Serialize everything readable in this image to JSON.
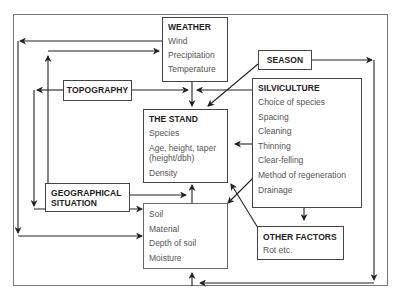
{
  "diagram": {
    "weather": {
      "title": "WEATHER",
      "items": [
        "Wind",
        "Precipitation",
        "Temperature"
      ]
    },
    "season": {
      "title": "SEASON"
    },
    "topography": {
      "title": "TOPOGRAPHY"
    },
    "silviculture": {
      "title": "SILVICULTURE",
      "items": [
        "Choice of species",
        "Spacing",
        "Cleaning",
        "Thinning",
        "Clear-felling",
        "Method of regeneration",
        "Drainage"
      ]
    },
    "stand": {
      "title": "THE STAND",
      "items": [
        "Species",
        "Age, height, taper (height/dbh)",
        "Density"
      ]
    },
    "geographical": {
      "title_line1": "GEOGRAPHICAL",
      "title_line2": "SITUATION"
    },
    "soil": {
      "items": [
        "Soil",
        "Material",
        "Depth of soil",
        "Moisture"
      ]
    },
    "other_factors": {
      "title": "OTHER FACTORS",
      "items": [
        "Rot etc."
      ]
    },
    "colors": {
      "line": "#222222",
      "frame": "#777777",
      "title_text": "#222222",
      "item_text": "#555555"
    }
  }
}
